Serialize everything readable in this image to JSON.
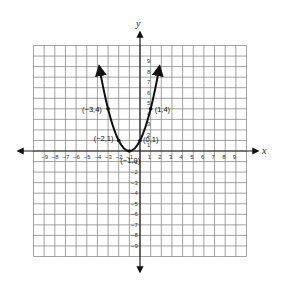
{
  "chart_data": {
    "type": "line",
    "title": "",
    "function": "y = (x + 1)^2",
    "xlabel": "x",
    "ylabel": "y",
    "xlim": [
      -10,
      10
    ],
    "ylim": [
      -10,
      10
    ],
    "grid": true,
    "x_tick_labels": [
      "-9",
      "-8",
      "-7",
      "-6",
      "-5",
      "-4",
      "-3",
      "-2",
      "-1",
      "1",
      "2",
      "3",
      "4",
      "5",
      "6",
      "7",
      "8",
      "9"
    ],
    "y_tick_labels": [
      "9",
      "8",
      "7",
      "6",
      "5",
      "4",
      "3",
      "2",
      "1",
      "-1",
      "-2",
      "-3",
      "-4",
      "-5",
      "-6",
      "-7",
      "-8",
      "-9"
    ],
    "curve_x_range": [
      -4,
      2
    ],
    "curve_ends_arrows": true,
    "points": [
      {
        "x": -3,
        "y": 4,
        "label": "(−3,4)"
      },
      {
        "x": -2,
        "y": 1,
        "label": "(−2,1)"
      },
      {
        "x": -1,
        "y": 0,
        "label": "(−1,0)"
      },
      {
        "x": 0,
        "y": 1,
        "label": "(0,1)"
      },
      {
        "x": 1,
        "y": 4,
        "label": "(1,4)"
      }
    ]
  },
  "colors": {
    "grid": "#8a8a8a",
    "axis": "#1a1a1a",
    "curve": "#111111"
  }
}
